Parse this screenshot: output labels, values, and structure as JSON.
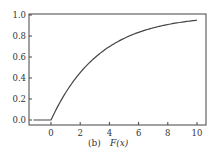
{
  "chart_data": {
    "type": "line",
    "title": "",
    "caption": "(b) F(x)",
    "caption_label": "(b)",
    "caption_func": "F(x)",
    "xlabel": "",
    "ylabel": "",
    "xlim": [
      -1.5,
      10.6
    ],
    "ylim": [
      -0.03,
      1.0
    ],
    "xticks": [
      0,
      2,
      4,
      6,
      8,
      10
    ],
    "xtick_labels": [
      "0",
      "2",
      "4",
      "6",
      "8",
      "10"
    ],
    "yticks": [
      0.0,
      0.2,
      0.4,
      0.6,
      0.8,
      1.0
    ],
    "ytick_labels": [
      "0.0",
      "0.2",
      "0.4",
      "0.6",
      "0.8",
      "1.0"
    ],
    "grid": false,
    "legend": null,
    "series": [
      {
        "name": "F(x)",
        "color": "#444444",
        "x": [
          -1.2,
          0,
          0.5,
          1,
          1.5,
          2,
          3,
          4,
          5,
          6,
          7,
          8,
          9,
          10
        ],
        "y": [
          0.0,
          0.0,
          0.14,
          0.26,
          0.36,
          0.45,
          0.59,
          0.7,
          0.78,
          0.83,
          0.88,
          0.91,
          0.93,
          0.95
        ]
      }
    ]
  }
}
